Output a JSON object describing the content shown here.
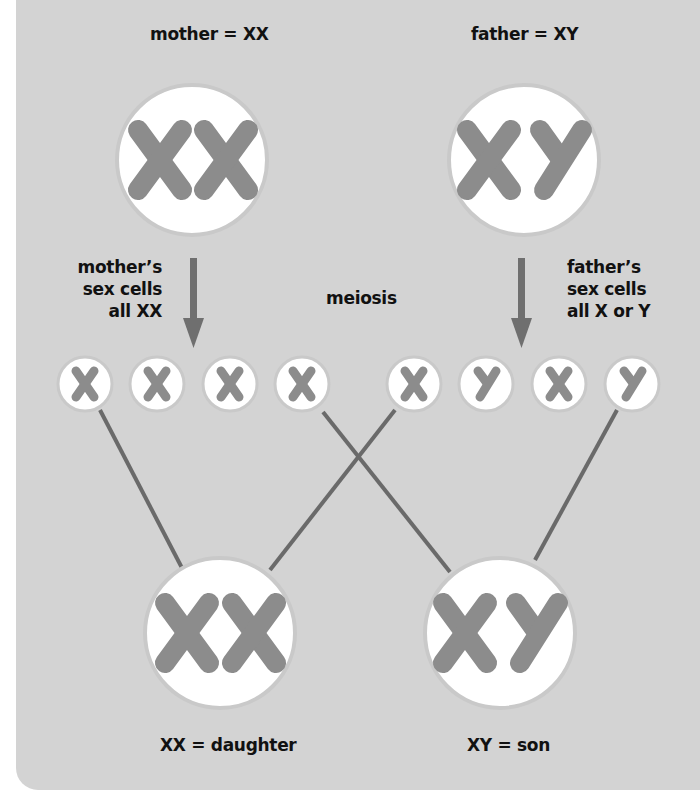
{
  "colors": {
    "panel_background": "#d3d3d3",
    "cell_fill": "#ffffff",
    "cell_ring": "#c9c9c9",
    "chromosome": "#8c8c8c",
    "arrow": "#6f6f6f",
    "line": "#6a6a6a",
    "text": "#111111"
  },
  "parents": {
    "mother": {
      "label": "mother = XX",
      "chromosomes": [
        "X",
        "X"
      ]
    },
    "father": {
      "label": "father = XY",
      "chromosomes": [
        "X",
        "Y"
      ]
    }
  },
  "annotations": {
    "mother_cells": [
      "mother’s",
      "sex cells",
      "all XX"
    ],
    "meiosis": "meiosis",
    "father_cells": [
      "father’s",
      "sex cells",
      "all X or Y"
    ]
  },
  "gametes": {
    "mother": [
      "X",
      "X",
      "X",
      "X"
    ],
    "father": [
      "X",
      "Y",
      "X",
      "Y"
    ]
  },
  "offspring": {
    "daughter": {
      "label": "XX = daughter",
      "chromosomes": [
        "X",
        "X"
      ]
    },
    "son": {
      "label": "XY = son",
      "chromosomes": [
        "X",
        "Y"
      ]
    }
  },
  "connections": [
    {
      "from": "mother_gamete_1",
      "to": "daughter"
    },
    {
      "from": "father_gamete_1",
      "to": "daughter"
    },
    {
      "from": "mother_gamete_4",
      "to": "son"
    },
    {
      "from": "father_gamete_4",
      "to": "son"
    }
  ]
}
